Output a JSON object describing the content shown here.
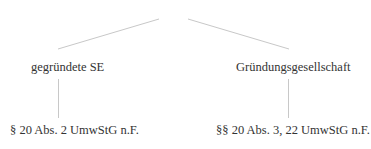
{
  "diagram": {
    "type": "tree",
    "line_color": "#c8c8c8",
    "nodes": {
      "left": {
        "label": "gegründete SE"
      },
      "right": {
        "label": "Gründungsgesellschaft"
      },
      "left_child": {
        "label": "§ 20 Abs. 2 UmwStG n.F."
      },
      "right_child": {
        "label": "§§ 20 Abs. 3, 22 UmwStG n.F."
      }
    }
  }
}
